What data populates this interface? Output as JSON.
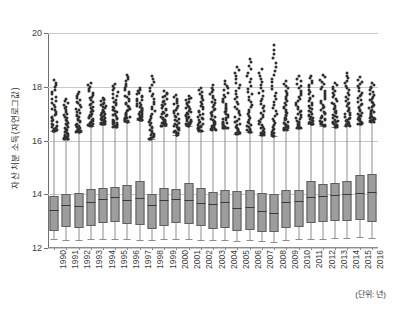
{
  "chart_data": {
    "type": "boxplot",
    "title": "",
    "xlabel": "",
    "ylabel": "자산 처분 소득(자연로그값)",
    "unit_note": "(단위: 년)",
    "ylim": [
      12,
      20
    ],
    "yticks": [
      12,
      14,
      16,
      18,
      20
    ],
    "ytick_labels": [
      "12",
      "14",
      "16",
      "18",
      "20"
    ],
    "grid": true,
    "legend": "none",
    "categories": [
      "1990",
      "1991",
      "1992",
      "1993",
      "1994",
      "1995",
      "1996",
      "1997",
      "1998",
      "1999",
      "2000",
      "2001",
      "2002",
      "2003",
      "2004",
      "2005",
      "2006",
      "2007",
      "2008",
      "2009",
      "2010",
      "2011",
      "2012",
      "2013",
      "2014",
      "2015",
      "2016"
    ],
    "boxes": [
      {
        "year": "1990",
        "whisker_low": 12.35,
        "q1": 12.62,
        "median": 13.43,
        "q3": 13.92,
        "whisker_high": 16.35,
        "outlier_max": 18.25
      },
      {
        "year": "1991",
        "whisker_low": 12.3,
        "q1": 12.78,
        "median": 13.6,
        "q3": 14.02,
        "whisker_high": 16.05,
        "outlier_max": 17.55
      },
      {
        "year": "1992",
        "whisker_low": 12.28,
        "q1": 12.74,
        "median": 13.55,
        "q3": 14.05,
        "whisker_high": 16.3,
        "outlier_max": 17.8
      },
      {
        "year": "1993",
        "whisker_low": 12.32,
        "q1": 12.82,
        "median": 13.7,
        "q3": 14.18,
        "whisker_high": 16.55,
        "outlier_max": 18.15
      },
      {
        "year": "1994",
        "whisker_low": 12.34,
        "q1": 12.92,
        "median": 13.82,
        "q3": 14.25,
        "whisker_high": 16.6,
        "outlier_max": 17.6
      },
      {
        "year": "1995",
        "whisker_low": 12.33,
        "q1": 12.95,
        "median": 13.88,
        "q3": 14.28,
        "whisker_high": 16.5,
        "outlier_max": 18.1
      },
      {
        "year": "1996",
        "whisker_low": 12.35,
        "q1": 12.9,
        "median": 13.78,
        "q3": 14.35,
        "whisker_high": 16.7,
        "outlier_max": 18.45
      },
      {
        "year": "1997",
        "whisker_low": 12.3,
        "q1": 12.86,
        "median": 13.85,
        "q3": 14.48,
        "whisker_high": 16.75,
        "outlier_max": 17.95
      },
      {
        "year": "1998",
        "whisker_low": 12.3,
        "q1": 12.7,
        "median": 13.6,
        "q3": 14.0,
        "whisker_high": 16.05,
        "outlier_max": 18.4
      },
      {
        "year": "1999",
        "whisker_low": 12.32,
        "q1": 12.8,
        "median": 13.78,
        "q3": 14.22,
        "whisker_high": 16.55,
        "outlier_max": 17.85
      },
      {
        "year": "2000",
        "whisker_low": 12.35,
        "q1": 12.92,
        "median": 13.84,
        "q3": 14.2,
        "whisker_high": 16.2,
        "outlier_max": 17.7
      },
      {
        "year": "2001",
        "whisker_low": 12.33,
        "q1": 12.9,
        "median": 13.8,
        "q3": 14.42,
        "whisker_high": 16.55,
        "outlier_max": 17.65
      },
      {
        "year": "2002",
        "whisker_low": 12.3,
        "q1": 12.8,
        "median": 13.68,
        "q3": 14.22,
        "whisker_high": 16.35,
        "outlier_max": 17.95
      },
      {
        "year": "2003",
        "whisker_low": 12.28,
        "q1": 12.72,
        "median": 13.62,
        "q3": 14.1,
        "whisker_high": 16.4,
        "outlier_max": 18.05
      },
      {
        "year": "2004",
        "whisker_low": 12.3,
        "q1": 12.76,
        "median": 13.7,
        "q3": 14.14,
        "whisker_high": 16.45,
        "outlier_max": 18.2
      },
      {
        "year": "2005",
        "whisker_low": 12.26,
        "q1": 12.62,
        "median": 13.48,
        "q3": 14.12,
        "whisker_high": 16.25,
        "outlier_max": 18.75
      },
      {
        "year": "2006",
        "whisker_low": 12.28,
        "q1": 12.66,
        "median": 13.52,
        "q3": 14.15,
        "whisker_high": 16.3,
        "outlier_max": 19.05
      },
      {
        "year": "2007",
        "whisker_low": 12.25,
        "q1": 12.6,
        "median": 13.38,
        "q3": 14.05,
        "whisker_high": 16.2,
        "outlier_max": 18.65
      },
      {
        "year": "2008",
        "whisker_low": 12.24,
        "q1": 12.58,
        "median": 13.3,
        "q3": 14.0,
        "whisker_high": 16.15,
        "outlier_max": 19.55
      },
      {
        "year": "2009",
        "whisker_low": 12.3,
        "q1": 12.74,
        "median": 13.7,
        "q3": 14.14,
        "whisker_high": 16.4,
        "outlier_max": 18.2
      },
      {
        "year": "2010",
        "whisker_low": 12.32,
        "q1": 12.78,
        "median": 13.74,
        "q3": 14.16,
        "whisker_high": 16.45,
        "outlier_max": 18.4
      },
      {
        "year": "2011",
        "whisker_low": 12.34,
        "q1": 12.92,
        "median": 13.9,
        "q3": 14.48,
        "whisker_high": 16.6,
        "outlier_max": 18.4
      },
      {
        "year": "2012",
        "whisker_low": 12.35,
        "q1": 12.96,
        "median": 13.95,
        "q3": 14.38,
        "whisker_high": 16.55,
        "outlier_max": 18.45
      },
      {
        "year": "2013",
        "whisker_low": 12.36,
        "q1": 13.0,
        "median": 13.98,
        "q3": 14.42,
        "whisker_high": 16.5,
        "outlier_max": 18.15
      },
      {
        "year": "2014",
        "whisker_low": 12.38,
        "q1": 13.02,
        "median": 14.0,
        "q3": 14.5,
        "whisker_high": 16.55,
        "outlier_max": 18.5
      },
      {
        "year": "2015",
        "whisker_low": 12.4,
        "q1": 13.05,
        "median": 14.06,
        "q3": 14.7,
        "whisker_high": 16.6,
        "outlier_max": 18.35
      },
      {
        "year": "2016",
        "whisker_low": 12.38,
        "q1": 12.96,
        "median": 14.08,
        "q3": 14.75,
        "whisker_high": 16.7,
        "outlier_max": 18.15
      }
    ]
  }
}
